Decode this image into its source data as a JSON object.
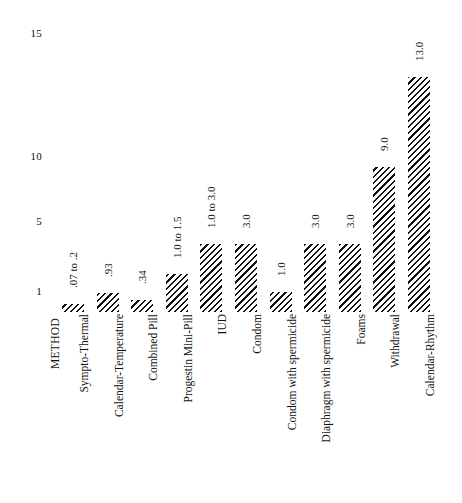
{
  "chart_data": {
    "type": "bar",
    "title": "",
    "subtitle": "",
    "xlabel": "METHOD",
    "ylabel": "",
    "orientation": "vertical",
    "grid": false,
    "legend": null,
    "yscale": "log",
    "ylim": [
      0.07,
      15
    ],
    "yticks": [
      1,
      5,
      10,
      15
    ],
    "ytick_labels": [
      "1",
      "5",
      "10",
      "15"
    ],
    "categories": [
      "Sympto-Thermal",
      "Calendar-Temperature",
      "Combined Pill",
      "Progestin Mini-Pill",
      "IUD",
      "Condom",
      "Condom with spermicide",
      "Diaphragm with spermicide",
      "Foams",
      "Withdrawal",
      "Calendar-Rhythm"
    ],
    "values": [
      0.2,
      0.93,
      0.34,
      1.5,
      3.0,
      3.0,
      1.0,
      3.0,
      3.0,
      9.0,
      13.0
    ],
    "value_labels": [
      ".07 to .2",
      ".93",
      ".34",
      "1.0 to 1.5",
      "1.0 to 3.0",
      "3.0",
      "1.0",
      "3.0",
      "3.0",
      "9.0",
      "13.0"
    ]
  },
  "style": {
    "bar_fill": "#ffffff",
    "bar_hatch_color": "#111111",
    "text_color": "#111111",
    "background": "#ffffff"
  }
}
